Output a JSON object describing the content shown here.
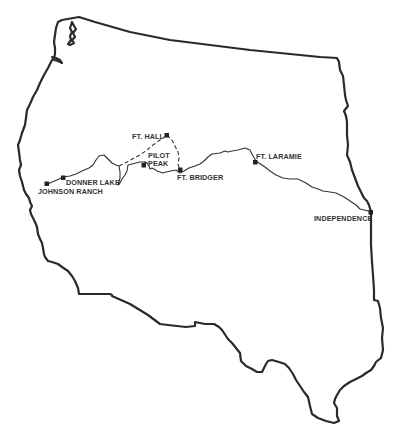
{
  "map": {
    "title": "Western United States with emigrant trail route",
    "colors": {
      "background": "#ffffff",
      "outline": "#2a2a2a",
      "trail": "#333333",
      "marker": "#222222",
      "label": "#333333"
    },
    "locations": [
      {
        "id": "johnson-ranch",
        "label": "JOHNSON RANCH"
      },
      {
        "id": "donner-lake",
        "label": "DONNER LAKE"
      },
      {
        "id": "pilot-peak",
        "label_line1": "PILOT",
        "label_line2": "PEAK"
      },
      {
        "id": "ft-hall",
        "label": "FT. HALL"
      },
      {
        "id": "ft-bridger",
        "label": "FT. BRIDGER"
      },
      {
        "id": "ft-laramie",
        "label": "FT. LARAMIE"
      },
      {
        "id": "independence",
        "label": "INDEPENDENCE"
      }
    ],
    "routes": [
      {
        "id": "main-trail",
        "style": "solid",
        "from": "INDEPENDENCE",
        "to": "JOHNSON RANCH"
      },
      {
        "id": "ft-hall-branch",
        "style": "dashed",
        "via": "FT. HALL"
      }
    ]
  }
}
